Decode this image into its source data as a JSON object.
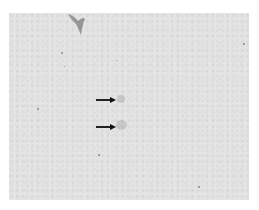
{
  "image": {
    "description": "Grayscale light micrograph with two black arrows pointing at faint structures",
    "background_color": "#e4e4e4",
    "frame": {
      "left": 9,
      "top": 13,
      "width": 240,
      "height": 187
    }
  },
  "annotations": {
    "arrows": [
      {
        "name": "arrow-upper",
        "x": 87,
        "y": 85,
        "length": 20,
        "direction": "right",
        "color": "#111111"
      },
      {
        "name": "arrow-lower",
        "x": 87,
        "y": 112,
        "length": 20,
        "direction": "right",
        "color": "#111111"
      }
    ]
  },
  "features": {
    "targets": [
      {
        "name": "target-upper",
        "x": 111,
        "y": 86
      },
      {
        "name": "target-lower",
        "x": 112,
        "y": 112
      }
    ],
    "specks": [
      {
        "x": 52,
        "y": 39,
        "size": 2
      },
      {
        "x": 28,
        "y": 95,
        "size": 2
      },
      {
        "x": 89,
        "y": 141,
        "size": 2
      },
      {
        "x": 234,
        "y": 30,
        "size": 2
      },
      {
        "x": 189,
        "y": 173,
        "size": 2
      },
      {
        "x": 107,
        "y": 47,
        "size": 1
      },
      {
        "x": 55,
        "y": 53,
        "size": 1
      }
    ]
  }
}
